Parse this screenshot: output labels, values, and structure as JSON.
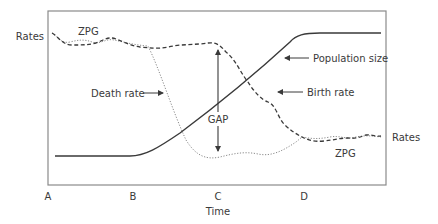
{
  "diagram": {
    "colors": {
      "frame": "#8a8a8a",
      "population": "#3a3a3a",
      "birth_rate": "#3a3a3a",
      "death_rate": "#8a8a8a",
      "text": "#3a3a3a"
    },
    "axis": {
      "x_label": "Time",
      "ticks": [
        "A",
        "B",
        "C",
        "D"
      ]
    },
    "labels": {
      "rates_left": "Rates",
      "rates_right": "Rates",
      "zpg_top": "ZPG",
      "zpg_bottom": "ZPG",
      "death_rate": "Death rate",
      "population_size": "Population size",
      "birth_rate": "Birth rate",
      "gap": "GAP"
    },
    "series": [
      {
        "name": "Population size",
        "style": "solid"
      },
      {
        "name": "Birth rate",
        "style": "dashed"
      },
      {
        "name": "Death rate",
        "style": "dotted"
      }
    ]
  }
}
